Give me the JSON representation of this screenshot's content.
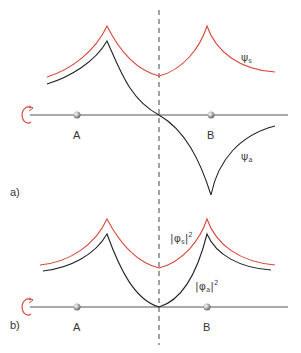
{
  "figure": {
    "panels": [
      {
        "id": "a",
        "label": "a)",
        "atom_labels": [
          "A",
          "B"
        ],
        "curves": [
          {
            "name": "ψs",
            "symbol": "ψ",
            "subscript": "s",
            "color": "#d9483b",
            "description": "symmetric wavefunction"
          },
          {
            "name": "ψa",
            "symbol": "ψ",
            "subscript": "a",
            "color": "#222222",
            "description": "antisymmetric wavefunction"
          }
        ]
      },
      {
        "id": "b",
        "label": "b)",
        "atom_labels": [
          "A",
          "B"
        ],
        "curves": [
          {
            "name": "|φs|²",
            "symbol": "φ",
            "subscript": "s",
            "exponent": "2",
            "color": "#d9483b",
            "description": "symmetric probability density"
          },
          {
            "name": "|φa|²",
            "symbol": "φ",
            "subscript": "a",
            "exponent": "2",
            "color": "#222222",
            "description": "antisymmetric probability density"
          }
        ]
      }
    ],
    "symmetry_axis": "dashed vertical line",
    "rotation_icon": "rotation-arrow"
  },
  "colors": {
    "red": "#d9483b",
    "black": "#222222",
    "axis": "#444444",
    "atom": "#9a9a9a"
  },
  "text": {
    "panel_a_label": "a)",
    "panel_b_label": "b)",
    "atom_a": "A",
    "atom_b": "B",
    "psi": "ψ",
    "phi": "φ",
    "sub_s": "s",
    "sub_a": "a",
    "exp_2": "2",
    "bar": "|"
  }
}
